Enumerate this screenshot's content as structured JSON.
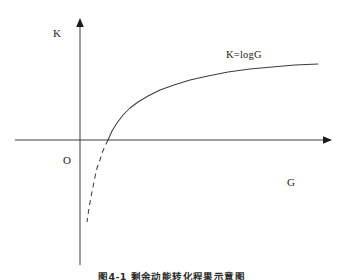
{
  "figure": {
    "caption": "图4-1  剩余动能转化程果示意图",
    "background_color": "#ffffff",
    "stroke_color": "#3c3c3c"
  },
  "axes": {
    "y_axis_label": "K",
    "x_axis_label": "G",
    "origin_label": "O",
    "y_axis_name": "y-axis",
    "x_axis_name": "x-axis"
  },
  "chart_data": {
    "type": "line",
    "title": "图4-1  剩余动能转化程果示意图",
    "xlabel": "G",
    "ylabel": "K",
    "grid": false,
    "legend": false,
    "annotations": [
      {
        "text": "K=logG",
        "x": 226,
        "y": 50
      },
      {
        "text": "O",
        "x": 63,
        "y": 155
      }
    ],
    "axis_origin_px": {
      "x": 80,
      "y": 140
    },
    "x_axis_extent_px": {
      "from": 15,
      "to": 332
    },
    "y_axis_extent_px": {
      "from": 18,
      "to": 265
    },
    "series": [
      {
        "name": "K=logG (solid branch, G>1)",
        "style": "solid",
        "equation": "K=logG",
        "points_px": [
          [
            108,
            140
          ],
          [
            112,
            131
          ],
          [
            117,
            123
          ],
          [
            123,
            115
          ],
          [
            130,
            108
          ],
          [
            138,
            102
          ],
          [
            148,
            96
          ],
          [
            160,
            90
          ],
          [
            174,
            85
          ],
          [
            190,
            80
          ],
          [
            208,
            76
          ],
          [
            228,
            72
          ],
          [
            250,
            69
          ],
          [
            272,
            67
          ],
          [
            295,
            65
          ],
          [
            318,
            64
          ]
        ]
      },
      {
        "name": "K=logG (dashed branch, 0<G<1)",
        "style": "dashed",
        "equation": "K=logG",
        "points_px": [
          [
            108,
            140
          ],
          [
            105,
            146
          ],
          [
            102,
            153
          ],
          [
            100,
            160
          ],
          [
            97,
            168
          ],
          [
            95,
            177
          ],
          [
            93,
            187
          ],
          [
            91,
            197
          ],
          [
            89,
            208
          ],
          [
            88,
            215
          ],
          [
            87,
            222
          ]
        ]
      }
    ]
  }
}
